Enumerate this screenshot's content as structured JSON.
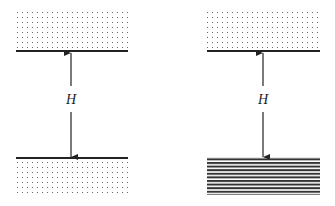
{
  "panels": [
    {
      "id": "left",
      "top_surface": {
        "fill": "dotted"
      },
      "bottom_surface": {
        "fill": "dotted"
      },
      "separation_label": "H"
    },
    {
      "id": "right",
      "top_surface": {
        "fill": "dotted"
      },
      "bottom_surface": {
        "fill": "striped"
      },
      "separation_label": "H"
    }
  ],
  "colors": {
    "line": "#222222",
    "dots": "#555555",
    "stripes": "#333333",
    "background": "#ffffff"
  }
}
